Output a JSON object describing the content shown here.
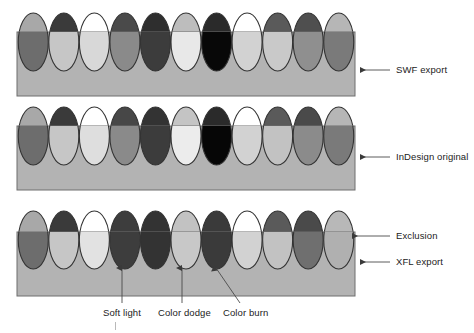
{
  "figure": {
    "background_color": "#ffffff",
    "band_fill": "#b3b3b3",
    "band_stroke": "#6e6e6e",
    "ellipse_stroke": "#333333",
    "label_color": "#222222",
    "leader_color": "#4a4a4a"
  },
  "rows": [
    {
      "id": "swf-export",
      "label": "SWF export",
      "band": {
        "x": 17,
        "y": 32,
        "width": 338,
        "height": 64
      },
      "ellipse_cy": 42,
      "ellipse_rx": 15,
      "ellipse_ry": 29,
      "ellipses": [
        {
          "name": "normal",
          "top": "#a8a8a8",
          "bottom": "#6d6d6d"
        },
        {
          "name": "multiply",
          "top": "#3a3a3a",
          "bottom": "#c6c6c6"
        },
        {
          "name": "screen",
          "top": "#ffffff",
          "bottom": "#d8d8d8"
        },
        {
          "name": "overlay",
          "top": "#4a4a4a",
          "bottom": "#8a8a8a"
        },
        {
          "name": "darken",
          "top": "#2e2e2e",
          "bottom": "#3c3c3c"
        },
        {
          "name": "lighten",
          "top": "#bdbdbd",
          "bottom": "#e8e8e8"
        },
        {
          "name": "color-dodge",
          "top": "#2a2a2a",
          "bottom": "#080808"
        },
        {
          "name": "color-burn",
          "top": "#ffffff",
          "bottom": "#d2d2d2"
        },
        {
          "name": "hard-light",
          "top": "#5a5a5a",
          "bottom": "#c9c9c9"
        },
        {
          "name": "soft-light",
          "top": "#4f4f4f",
          "bottom": "#8f8f8f"
        },
        {
          "name": "exclusion",
          "top": "#b6b6b6",
          "bottom": "#7a7a7a"
        }
      ],
      "leader": {
        "x1": 360,
        "y1": 70,
        "x2": 390,
        "y2": 70,
        "arrow": "left"
      },
      "label_pos": {
        "x": 396,
        "y": 65
      }
    },
    {
      "id": "indesign-original",
      "label": "InDesign original",
      "band": {
        "x": 17,
        "y": 126,
        "width": 338,
        "height": 64
      },
      "ellipse_cy": 136,
      "ellipse_rx": 15,
      "ellipse_ry": 29,
      "ellipses": [
        {
          "name": "normal",
          "top": "#a8a8a8",
          "bottom": "#6d6d6d"
        },
        {
          "name": "multiply",
          "top": "#3a3a3a",
          "bottom": "#c6c6c6"
        },
        {
          "name": "screen",
          "top": "#ffffff",
          "bottom": "#dedede"
        },
        {
          "name": "overlay",
          "top": "#474747",
          "bottom": "#8a8a8a"
        },
        {
          "name": "darken",
          "top": "#333333",
          "bottom": "#3c3c3c"
        },
        {
          "name": "lighten",
          "top": "#c4c4c4",
          "bottom": "#ececec"
        },
        {
          "name": "color-dodge",
          "top": "#2a2a2a",
          "bottom": "#060606"
        },
        {
          "name": "color-burn",
          "top": "#ffffff",
          "bottom": "#d2d2d2"
        },
        {
          "name": "hard-light",
          "top": "#5a5a5a",
          "bottom": "#c2c2c2"
        },
        {
          "name": "soft-light",
          "top": "#4a4a4a",
          "bottom": "#8b8b8b"
        },
        {
          "name": "exclusion",
          "top": "#b6b6b6",
          "bottom": "#7a7a7a"
        }
      ],
      "leader": {
        "x1": 360,
        "y1": 157,
        "x2": 390,
        "y2": 157,
        "arrow": "left"
      },
      "label_pos": {
        "x": 396,
        "y": 152
      }
    },
    {
      "id": "xfl-export",
      "label": "XFL export",
      "band": {
        "x": 17,
        "y": 232,
        "width": 338,
        "height": 64
      },
      "ellipse_cy": 240,
      "ellipse_rx": 15,
      "ellipse_ry": 29,
      "ellipses": [
        {
          "name": "normal",
          "top": "#a8a8a8",
          "bottom": "#6d6d6d"
        },
        {
          "name": "multiply",
          "top": "#3a3a3a",
          "bottom": "#c6c6c6"
        },
        {
          "name": "screen",
          "top": "#ffffff",
          "bottom": "#e2e2e2"
        },
        {
          "name": "soft-light",
          "top": "#3d3d3d",
          "bottom": "#3d3d3d"
        },
        {
          "name": "darken",
          "top": "#333333",
          "bottom": "#333333"
        },
        {
          "name": "color-dodge",
          "top": "#c2c2c2",
          "bottom": "#c8c8c8"
        },
        {
          "name": "color-burn",
          "top": "#3a3a3a",
          "bottom": "#3a3a3a"
        },
        {
          "name": "screen-2",
          "top": "#ffffff",
          "bottom": "#d2d2d2"
        },
        {
          "name": "hard-light",
          "top": "#5a5a5a",
          "bottom": "#c2c2c2"
        },
        {
          "name": "overlay",
          "top": "#4a4a4a",
          "bottom": "#6f6f6f"
        },
        {
          "name": "exclusion",
          "top": "#b8b8b8",
          "bottom": "#b0b0b0"
        }
      ],
      "leader": {
        "x1": 360,
        "y1": 262,
        "x2": 390,
        "y2": 262,
        "arrow": "left"
      },
      "label_pos": {
        "x": 396,
        "y": 257
      }
    }
  ],
  "annotations": [
    {
      "id": "exclusion",
      "label": "Exclusion",
      "target": {
        "x": 348,
        "y": 236
      },
      "leader": {
        "x1": 352,
        "y1": 236,
        "x2": 390,
        "y2": 236
      },
      "label_pos": {
        "x": 396,
        "y": 231
      },
      "arrow": "left"
    },
    {
      "id": "soft-light",
      "label": "Soft light",
      "target": {
        "x": 122,
        "y": 266
      },
      "leader": {
        "x1": 122,
        "y1": 268,
        "x2": 122,
        "y2": 303
      },
      "label_pos": {
        "x": 103,
        "y": 308
      },
      "arrow": "up"
    },
    {
      "id": "color-dodge",
      "label": "Color dodge",
      "target": {
        "x": 182,
        "y": 266
      },
      "leader": {
        "x1": 182,
        "y1": 268,
        "x2": 182,
        "y2": 303
      },
      "label_pos": {
        "x": 158,
        "y": 308
      },
      "arrow": "up"
    },
    {
      "id": "color-burn",
      "label": "Color burn",
      "target": {
        "x": 214,
        "y": 266
      },
      "leader": {
        "x1": 216,
        "y1": 268,
        "x2": 240,
        "y2": 303
      },
      "label_pos": {
        "x": 223,
        "y": 308
      },
      "arrow": "up"
    }
  ]
}
